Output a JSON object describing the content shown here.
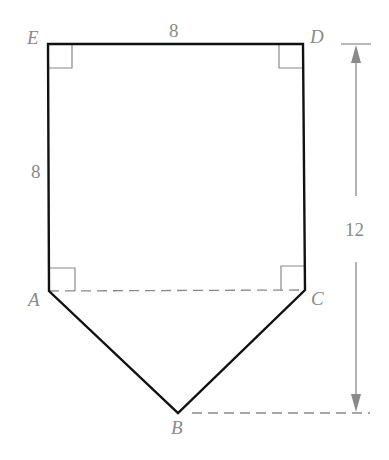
{
  "diagram": {
    "type": "geometry-figure",
    "vertices": {
      "E": {
        "label": "E"
      },
      "D": {
        "label": "D"
      },
      "C": {
        "label": "C"
      },
      "B": {
        "label": "B"
      },
      "A": {
        "label": "A"
      }
    },
    "dimensions": {
      "top_side": "8",
      "left_side": "8",
      "total_height": "12"
    },
    "right_angles": [
      "E",
      "D",
      "A",
      "C"
    ],
    "colors": {
      "outline": "#111111",
      "annotation": "#8a8a8a",
      "background": "#ffffff"
    }
  }
}
